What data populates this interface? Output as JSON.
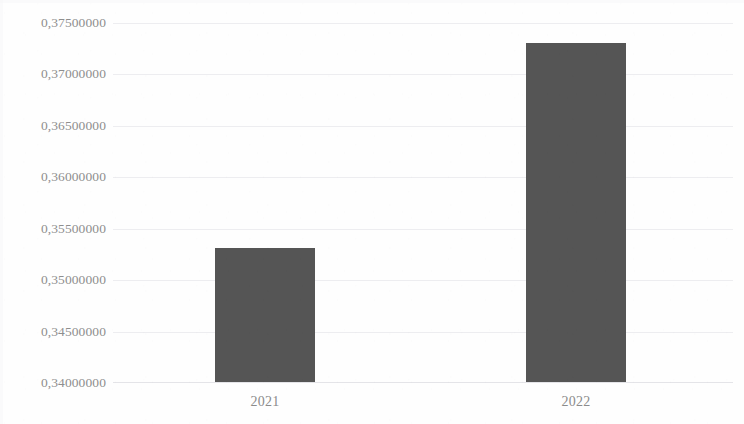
{
  "chart_data": {
    "type": "bar",
    "title": "",
    "subtitle": "",
    "xlabel": "",
    "ylabel": "",
    "categories": [
      "2021",
      "2022"
    ],
    "values": [
      0.353,
      0.373
    ],
    "value_labels": [
      "0,35300000",
      "0,37300000"
    ],
    "ylim": [
      0.34,
      0.375
    ],
    "ytick_values": [
      0.375,
      0.37,
      0.365,
      0.36,
      0.355,
      0.35,
      0.345,
      0.34
    ],
    "ytick_labels": [
      "0,37500000",
      "0,37000000",
      "0,36500000",
      "0,36000000",
      "0,35500000",
      "0,35000000",
      "0,34500000",
      "0,34000000"
    ],
    "ytick_step": 0.005,
    "decimal_separator": ",",
    "grid": true,
    "grid_axis": "y",
    "legend": false,
    "legend_position": "none",
    "series": [
      {
        "name": "",
        "values": [
          0.353,
          0.373
        ]
      }
    ]
  },
  "style": {
    "bar_color": "#555555",
    "grid_color": "#ededf0",
    "axis_color": "#e4e4e8",
    "tick_label_color": "#8e8e8e",
    "category_label_color": "#8b8b8b",
    "background_color": "#fefefe"
  }
}
